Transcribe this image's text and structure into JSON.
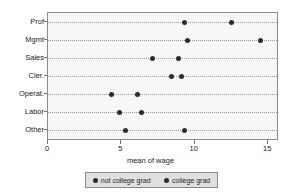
{
  "chart_data": {
    "type": "scatter",
    "title": "",
    "xlabel": "mean of wage",
    "ylabel": "",
    "xlim": [
      0,
      15.6
    ],
    "xticks": [
      0,
      5,
      10,
      15
    ],
    "xtick_labels": [
      "0",
      "5",
      "10",
      "15"
    ],
    "grid": true,
    "grid_axis": "y",
    "legend_position": "bottom",
    "categories": [
      "Prof",
      "Mgmt",
      "Sales",
      "Cler.",
      "Operat.",
      "Labor",
      "Other"
    ],
    "series": [
      {
        "name": "not college grad",
        "marker": "filled-circle",
        "color": "#2b2b2b",
        "values": [
          9.3,
          9.5,
          7.1,
          8.4,
          4.3,
          4.9,
          5.3
        ]
      },
      {
        "name": "college grad",
        "marker": "filled-circle",
        "color": "#2b2b2b",
        "values": [
          12.5,
          14.5,
          8.9,
          9.1,
          6.1,
          6.4,
          9.3
        ]
      }
    ]
  },
  "panel": {
    "background_color": "#f7f7f7",
    "border_color": "#8a8a8a",
    "gridline_color": "#9a9a9a"
  },
  "legend": {
    "background_color": "#e0e0e0",
    "border_color": "#8a8a8a",
    "entries": [
      {
        "label": "not college grad",
        "marker_name": "legend-marker-not-college-grad"
      },
      {
        "label": "college grad",
        "marker_name": "legend-marker-college-grad"
      }
    ]
  }
}
